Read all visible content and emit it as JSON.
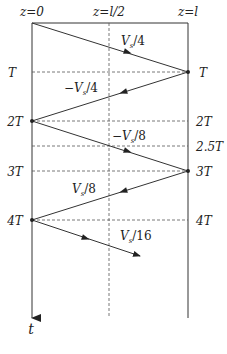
{
  "position_labels": [
    {
      "id": "z0",
      "text": "z=0",
      "x": 32
    },
    {
      "id": "zmid",
      "text": "z=l/2",
      "x": 109
    },
    {
      "id": "zl",
      "text": "z=l",
      "x": 188
    }
  ],
  "time_axis_label": "t",
  "time_levels": [
    {
      "id": "T",
      "left": "T",
      "right": "T",
      "y": 72
    },
    {
      "id": "2T",
      "left": "2T",
      "right": "2T",
      "y": 121
    },
    {
      "id": "2.5T",
      "left": "",
      "right": "2.5T",
      "y": 146
    },
    {
      "id": "3T",
      "left": "3T",
      "right": "3T",
      "y": 171
    },
    {
      "id": "4T",
      "left": "4T",
      "right": "4T",
      "y": 220
    }
  ],
  "waves": [
    {
      "label": "V_s/4",
      "main": "V",
      "sub": "s",
      "rest": "/4",
      "x1": 32,
      "y1": 23,
      "x2": 188,
      "y2": 72
    },
    {
      "label": "-V_s/4",
      "main": "−V",
      "sub": "s",
      "rest": "/4",
      "x1": 188,
      "y1": 72,
      "x2": 32,
      "y2": 121
    },
    {
      "label": "-V_s/8",
      "main": "−V",
      "sub": "s",
      "rest": "/8",
      "x1": 32,
      "y1": 121,
      "x2": 188,
      "y2": 171
    },
    {
      "label": "V_s/8",
      "main": "V",
      "sub": "s",
      "rest": "/8",
      "x1": 188,
      "y1": 171,
      "x2": 32,
      "y2": 220
    },
    {
      "label": "V_s/16",
      "main": "V",
      "sub": "s",
      "rest": "/16",
      "x1": 32,
      "y1": 220,
      "x2": 140,
      "y2": 256
    }
  ],
  "colors": {
    "line": "#333333",
    "dash": "#555555",
    "text": "#222222"
  }
}
